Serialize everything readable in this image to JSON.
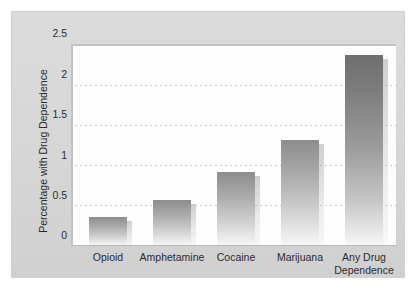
{
  "chart_data": {
    "type": "bar",
    "title": "",
    "xlabel": "",
    "ylabel": "Percentage with Drug Dependence",
    "categories": [
      "Opioid",
      "Amphetamine",
      "Cocaine",
      "Marijuana",
      "Any Drug Dependence"
    ],
    "category_lines": [
      [
        "Opioid"
      ],
      [
        "Amphetamine"
      ],
      [
        "Cocaine"
      ],
      [
        "Marijuana"
      ],
      [
        "Any Drug",
        "Dependence"
      ]
    ],
    "values": [
      0.37,
      0.58,
      0.93,
      1.33,
      2.4
    ],
    "ylim": [
      0,
      2.5
    ],
    "yticks": [
      0,
      0.5,
      1,
      1.5,
      2,
      2.5
    ],
    "ytick_labels": [
      "0",
      "0.5",
      "1",
      "1.5",
      "2",
      "2.5"
    ],
    "grid": "horizontal-dotted",
    "legend": "none",
    "bar_color": "#9a9a9a",
    "panel_color": "#d8d8d8",
    "plot_background": "#fdfdfd"
  }
}
